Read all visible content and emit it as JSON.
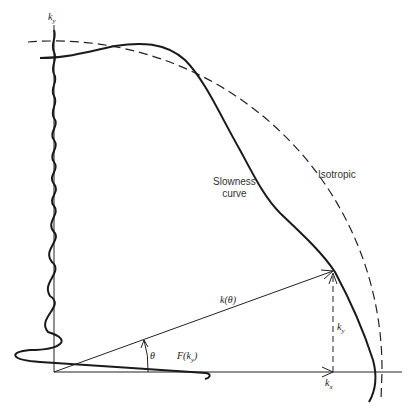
{
  "figure": {
    "type": "slowness-curve-diagram",
    "axes": {
      "vertical_label": "k_y",
      "horizontal_label": "k_x"
    },
    "labels": {
      "ky_axis": "k",
      "ky_axis_sub": "y",
      "slowness_line1": "Slowness",
      "slowness_line2": "curve",
      "isotropic": "Isotropic",
      "k_theta": "k(θ)",
      "theta": "θ",
      "ky_component": "k",
      "ky_component_sub": "y",
      "kx_component": "k",
      "kx_component_sub": "x",
      "F_ky": "F(k",
      "F_ky_sub": "y",
      "F_ky_close": ")"
    },
    "curves": [
      {
        "name": "Slowness curve",
        "style": "solid-thick"
      },
      {
        "name": "Isotropic",
        "style": "dashed circle arc"
      },
      {
        "name": "F(k_y)",
        "style": "solid-thick oscillating along k_y axis"
      }
    ],
    "colors": {
      "line": "#1a1a1a",
      "background": "#ffffff"
    }
  }
}
